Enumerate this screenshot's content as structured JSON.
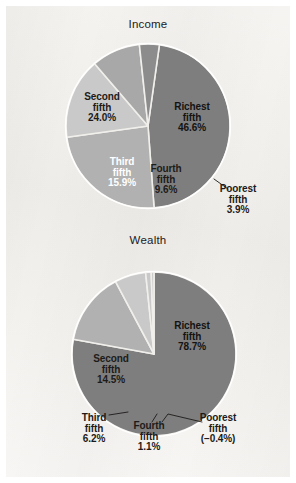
{
  "figure": {
    "background_color": "#f1efeb",
    "border_color": "#ffffff",
    "label_text_color": "#1d1b19",
    "title_text_color": "#22201e"
  },
  "palette": {
    "richest": "#7e7e7e",
    "second": "#b1b1b1",
    "third": "#c9c9c9",
    "fourth": "#a8a8a8",
    "poorest": "#8c8c8c",
    "slice_divider": "#ffffff"
  },
  "chart_data": [
    {
      "type": "pie",
      "title": "Income",
      "id": "income",
      "labels": [
        "Richest fifth",
        "Second fifth",
        "Third fifth",
        "Fourth fifth",
        "Poorest fifth"
      ],
      "values": [
        46.6,
        24.0,
        15.9,
        9.6,
        3.9
      ],
      "value_labels": [
        "46.6%",
        "24.0%",
        "15.9%",
        "9.6%",
        "3.9%"
      ],
      "slices": [
        {
          "name": "Richest fifth",
          "label_line1": "Richest",
          "label_line2": "fifth",
          "label_line3": "46.6%",
          "value": 46.6,
          "color": "#7e7e7e",
          "label_placement": "inside",
          "label_color": "#141312"
        },
        {
          "name": "Second fifth",
          "label_line1": "Second",
          "label_line2": "fifth",
          "label_line3": "24.0%",
          "value": 24.0,
          "color": "#b1b1b1",
          "label_placement": "inside",
          "label_color": "#1d1b19"
        },
        {
          "name": "Third fifth",
          "label_line1": "Third",
          "label_line2": "fifth",
          "label_line3": "15.9%",
          "value": 15.9,
          "color": "#c9c9c9",
          "label_placement": "inside",
          "label_color": "#ffffff"
        },
        {
          "name": "Fourth fifth",
          "label_line1": "Fourth",
          "label_line2": "fifth",
          "label_line3": "9.6%",
          "value": 9.6,
          "color": "#a8a8a8",
          "label_placement": "inside",
          "label_color": "#1d1b19"
        },
        {
          "name": "Poorest fifth",
          "label_line1": "Poorest",
          "label_line2": "fifth",
          "label_line3": "3.9%",
          "value": 3.9,
          "color": "#8c8c8c",
          "label_placement": "outside-leader",
          "label_color": "#1d1b19"
        }
      ]
    },
    {
      "type": "pie",
      "title": "Wealth",
      "id": "wealth",
      "labels": [
        "Richest fifth",
        "Second fifth",
        "Third fifth",
        "Fourth fifth",
        "Poorest fifth"
      ],
      "values": [
        78.7,
        14.5,
        6.2,
        1.1,
        -0.4
      ],
      "value_labels": [
        "78.7%",
        "14.5%",
        "6.2%",
        "1.1%",
        "(-0.4%)"
      ],
      "slices": [
        {
          "name": "Richest fifth",
          "label_line1": "Richest",
          "label_line2": "fifth",
          "label_line3": "78.7%",
          "value": 78.7,
          "color": "#7e7e7e",
          "label_placement": "inside",
          "label_color": "#141312"
        },
        {
          "name": "Second fifth",
          "label_line1": "Second",
          "label_line2": "fifth",
          "label_line3": "14.5%",
          "value": 14.5,
          "color": "#b1b1b1",
          "label_placement": "inside",
          "label_color": "#1d1b19"
        },
        {
          "name": "Third fifth",
          "label_line1": "Third",
          "label_line2": "fifth",
          "label_line3": "6.2%",
          "value": 6.2,
          "color": "#c9c9c9",
          "label_placement": "outside-leader",
          "label_color": "#1d1b19"
        },
        {
          "name": "Fourth fifth",
          "label_line1": "Fourth",
          "label_line2": "fifth",
          "label_line3": "1.1%",
          "value": 1.1,
          "color": "#c9c9c9",
          "label_placement": "outside-leader",
          "label_color": "#1d1b19"
        },
        {
          "name": "Poorest fifth",
          "label_line1": "Poorest",
          "label_line2": "fifth",
          "label_line3": "(−0.4%)",
          "value": -0.4,
          "color": "#c9c9c9",
          "label_placement": "outside-leader",
          "label_color": "#1d1b19"
        }
      ]
    }
  ]
}
